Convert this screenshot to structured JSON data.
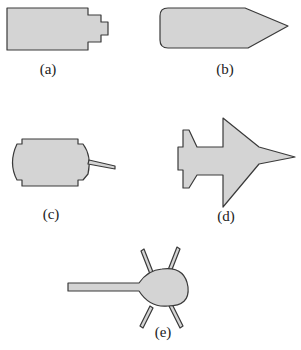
{
  "figure": {
    "colors": {
      "fill": "#d4d4d4",
      "stroke": "#3a3a3a",
      "background": "#ffffff",
      "label": "#222222"
    },
    "panels": [
      {
        "id": "a",
        "label": "(a)",
        "description": "rectangle with stepped right end"
      },
      {
        "id": "b",
        "label": "(b)",
        "description": "rounded rectangle with pointed right end"
      },
      {
        "id": "c",
        "label": "(c)",
        "description": "rounded body with notched corners and rod"
      },
      {
        "id": "d",
        "label": "(d)",
        "description": "aircraft-like shape"
      },
      {
        "id": "e",
        "label": "(e)",
        "description": "teardrop body with long handle and four legs"
      }
    ]
  }
}
